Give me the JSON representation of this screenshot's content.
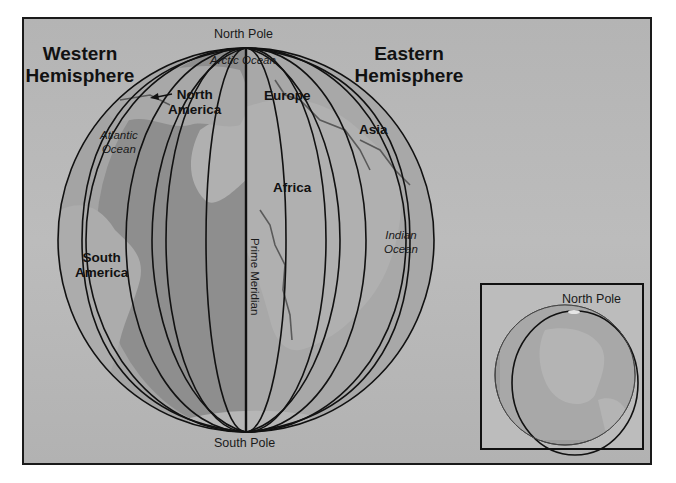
{
  "titles": {
    "western": "Western Hemisphere",
    "western_line1": "Western",
    "western_line2": "Hemisphere",
    "eastern_line1": "Eastern",
    "eastern_line2": "Hemisphere"
  },
  "poles": {
    "north": "North Pole",
    "south": "South Pole"
  },
  "continents": {
    "north_america_line1": "North",
    "north_america_line2": "America",
    "south_america_line1": "South",
    "south_america_line2": "America",
    "europe": "Europe",
    "africa": "Africa",
    "asia": "Asia"
  },
  "oceans": {
    "arctic": "Arctic Ocean",
    "atlantic_line1": "Atlantic",
    "atlantic_line2": "Ocean",
    "indian_line1": "Indian",
    "indian_line2": "Ocean"
  },
  "meridian": {
    "label": "Prime Meridian"
  },
  "inset": {
    "north_pole_label": "North Pole"
  },
  "colors": {
    "background": "#b8b8b8",
    "ocean_west": "#8f8f8f",
    "ocean_band": "#a2a2a2",
    "land": "#a9a9a9",
    "lines": "#111111"
  }
}
